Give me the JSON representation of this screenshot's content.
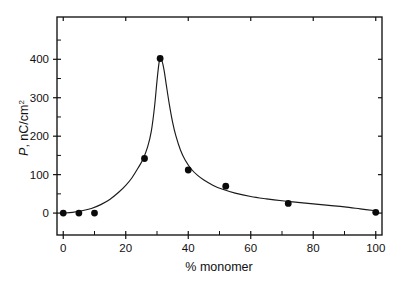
{
  "chart_data": {
    "type": "scatter",
    "title": "",
    "subtitle": "",
    "xlabel": "% monomer",
    "ylabel": "P, nC/cm2",
    "ylabel_parts": {
      "symbol": "P",
      "comma": ", ",
      "units": "nC/cm",
      "exponent": "2"
    },
    "x": [
      0,
      5,
      10,
      26,
      31,
      40,
      52,
      72,
      100
    ],
    "values": [
      0,
      0,
      0,
      142,
      402,
      112,
      70,
      25,
      2
    ],
    "series": [
      {
        "name": "P vs % monomer",
        "x": [
          0,
          5,
          10,
          26,
          31,
          40,
          52,
          72,
          100
        ],
        "values": [
          0,
          0,
          0,
          142,
          402,
          112,
          70,
          25,
          2
        ],
        "marker": "filled-circle",
        "marker_color": "#0a0a0a",
        "line": "fitted-curve",
        "line_color": "#1a1a1a"
      }
    ],
    "fit_curve": {
      "description": "smooth peaked fit through data, maximum near 31% monomer",
      "x": [
        0,
        3,
        6,
        9,
        12,
        15,
        18,
        20,
        22,
        24,
        25.5,
        27,
        28.2,
        29.2,
        30.0,
        30.6,
        31.0,
        31.6,
        32.3,
        33.0,
        34.0,
        35.0,
        36.0,
        37.5,
        39.0,
        41.0,
        43.0,
        45.0,
        48.0,
        51.0,
        55.0,
        60.0,
        65.0,
        70.0,
        75.0,
        80.0,
        85.0,
        90.0,
        95.0,
        100.0
      ],
      "y": [
        0,
        2,
        6,
        12,
        22,
        36,
        56,
        72,
        92,
        118,
        140,
        172,
        214,
        276,
        344,
        388,
        402,
        396,
        370,
        332,
        280,
        236,
        202,
        164,
        138,
        114,
        98,
        86,
        72,
        62,
        52,
        43,
        37,
        32,
        28,
        24,
        20,
        16,
        11,
        6
      ]
    },
    "xlim": [
      -2,
      102
    ],
    "ylim": [
      -57,
      510
    ],
    "xticks": [
      0,
      20,
      40,
      60,
      80,
      100
    ],
    "xtick_labels": [
      "0",
      "20",
      "40",
      "60",
      "80",
      "100"
    ],
    "xticks_minor": [
      10,
      30,
      50,
      70,
      90
    ],
    "yticks": [
      0,
      100,
      200,
      300,
      400
    ],
    "ytick_labels": [
      "0",
      "100",
      "200",
      "300",
      "400"
    ],
    "yticks_minor": [
      50,
      150,
      250,
      350,
      450
    ],
    "grid": false,
    "legend": null,
    "frame": "box",
    "tick_direction": "in-out",
    "background": "#ffffff"
  },
  "figure": {
    "background_color": "#ffffff",
    "foreground_color": "#111111"
  }
}
